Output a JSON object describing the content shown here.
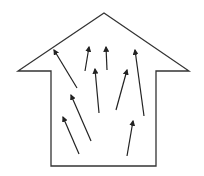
{
  "diagram": {
    "type": "house-with-upward-arrows",
    "stroke_color": "#333333",
    "background": "#ffffff",
    "house_outline": [
      [
        51,
        166
      ],
      [
        51,
        71
      ],
      [
        18,
        71
      ],
      [
        104,
        13
      ],
      [
        189,
        71
      ],
      [
        156,
        71
      ],
      [
        156,
        166
      ]
    ],
    "arrows": [
      {
        "tail": [
          77,
          88
        ],
        "head": [
          54,
          50
        ]
      },
      {
        "tail": [
          85,
          71
        ],
        "head": [
          89,
          47
        ]
      },
      {
        "tail": [
          107,
          70
        ],
        "head": [
          106,
          47
        ]
      },
      {
        "tail": [
          99,
          113
        ],
        "head": [
          95,
          69
        ]
      },
      {
        "tail": [
          116,
          110
        ],
        "head": [
          127,
          70
        ]
      },
      {
        "tail": [
          144,
          116
        ],
        "head": [
          135,
          50
        ]
      },
      {
        "tail": [
          91,
          141
        ],
        "head": [
          71,
          95
        ]
      },
      {
        "tail": [
          79,
          154
        ],
        "head": [
          63,
          117
        ]
      },
      {
        "tail": [
          127,
          156
        ],
        "head": [
          133,
          121
        ]
      }
    ]
  }
}
